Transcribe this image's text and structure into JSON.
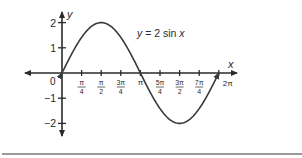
{
  "chart_data": {
    "type": "line",
    "title": "",
    "function_label": "y = 2 sin x",
    "xlabel": "x",
    "ylabel": "y",
    "x_ticks": [
      {
        "value": 0.7854,
        "num": "π",
        "den": "4"
      },
      {
        "value": 1.5708,
        "num": "π",
        "den": "2"
      },
      {
        "value": 2.3562,
        "num": "3π",
        "den": "4"
      },
      {
        "value": 3.1416,
        "label": "π"
      },
      {
        "value": 3.927,
        "num": "5π",
        "den": "4"
      },
      {
        "value": 4.7124,
        "num": "3π",
        "den": "2"
      },
      {
        "value": 5.4978,
        "num": "7π",
        "den": "4"
      },
      {
        "value": 6.2832,
        "label": "2π"
      }
    ],
    "y_ticks": [
      2,
      1,
      -1,
      -2
    ],
    "y_tick_labels": [
      "2",
      "1",
      "−1",
      "−2"
    ],
    "origin_label": "0",
    "series": [
      {
        "name": "y = 2 sin x",
        "x": [
          0,
          0.7854,
          1.5708,
          2.3562,
          3.1416,
          3.927,
          4.7124,
          5.4978,
          6.2832
        ],
        "values": [
          0,
          1.414,
          2,
          1.414,
          0,
          -1.414,
          -2,
          -1.414,
          0
        ]
      }
    ],
    "xlim": [
      -1.9,
      7.0
    ],
    "ylim": [
      -2.5,
      2.5
    ],
    "grid": false,
    "legend": "none",
    "colors": {
      "axis": "#2a2a2a",
      "curve": "#3a3a3a",
      "rule": "#9a9a9a"
    }
  }
}
